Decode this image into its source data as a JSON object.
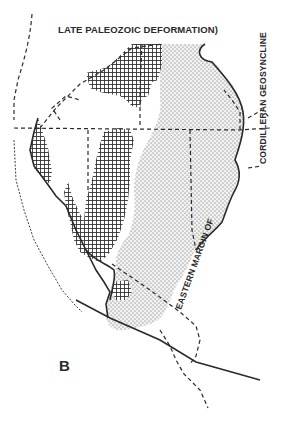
{
  "figure": {
    "panel_label": "B",
    "labels": {
      "top": "LATE PALEOZOIC DEFORMATION)",
      "right_vertical": "CORDILLERAN GEOSYNCLINE",
      "lower_diagonal": "EASTERN MARGIN OF"
    },
    "legend_patterns": [
      {
        "name": "crosshatch",
        "meaning": "cross-hatched terrane"
      },
      {
        "name": "stipple",
        "meaning": "stippled terrane"
      }
    ],
    "colors": {
      "ink": "#2a2a2a",
      "background": "#ffffff"
    }
  }
}
